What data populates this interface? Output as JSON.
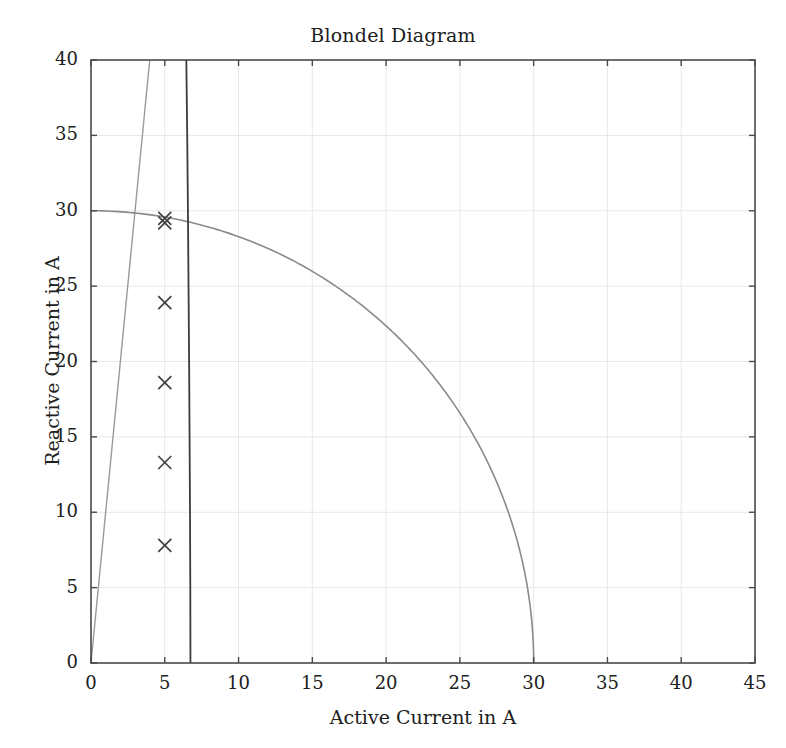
{
  "chart_data": {
    "type": "scatter",
    "title": "Blondel Diagram",
    "xlabel": "Active Current in A",
    "ylabel": "Reactive Current in A",
    "xlim": [
      0,
      45
    ],
    "ylim": [
      0,
      40
    ],
    "xticks": [
      0,
      5,
      10,
      15,
      20,
      25,
      30,
      35,
      40,
      45
    ],
    "yticks": [
      0,
      5,
      10,
      15,
      20,
      25,
      30,
      35,
      40
    ],
    "grid": true,
    "legend": "none",
    "series": [
      {
        "name": "operating-points",
        "type": "scatter",
        "marker": "x",
        "color": "#404040",
        "points": [
          {
            "x": 5.0,
            "y": 29.5
          },
          {
            "x": 5.0,
            "y": 29.2
          },
          {
            "x": 5.0,
            "y": 23.9
          },
          {
            "x": 5.0,
            "y": 18.6
          },
          {
            "x": 5.0,
            "y": 13.3
          },
          {
            "x": 5.0,
            "y": 7.8
          }
        ]
      },
      {
        "name": "stator-current-limit-arc",
        "type": "line",
        "color": "#8a8a8a",
        "description": "Quarter circle of radius 30 A centred on the origin",
        "radius": 30,
        "center": [
          0,
          0
        ]
      },
      {
        "name": "power-factor-line",
        "type": "line",
        "color": "#9a9a9a",
        "description": "Straight line from the origin through the operating region",
        "points": [
          {
            "x": 0,
            "y": 0
          },
          {
            "x": 3.98,
            "y": 40
          }
        ]
      },
      {
        "name": "excitation-limit-curve",
        "type": "line",
        "color": "#3c3c3c",
        "description": "Near-vertical excitation limit curve",
        "points": [
          {
            "x": 6.46,
            "y": 40
          },
          {
            "x": 6.52,
            "y": 35
          },
          {
            "x": 6.57,
            "y": 30
          },
          {
            "x": 6.61,
            "y": 25
          },
          {
            "x": 6.65,
            "y": 20
          },
          {
            "x": 6.68,
            "y": 15
          },
          {
            "x": 6.71,
            "y": 10
          },
          {
            "x": 6.73,
            "y": 5
          },
          {
            "x": 6.74,
            "y": 0
          }
        ]
      }
    ]
  },
  "axes": {
    "plot_left_px": 91,
    "plot_right_px": 755,
    "plot_top_px": 60,
    "plot_bottom_px": 663
  },
  "colors": {
    "frame": "#4a4a4a",
    "grid": "#e8e8e8",
    "marker": "#404040",
    "arc": "#8a8a8a",
    "pf_line": "#9a9a9a",
    "excitation": "#3c3c3c",
    "text": "#202020",
    "background": "#ffffff"
  }
}
